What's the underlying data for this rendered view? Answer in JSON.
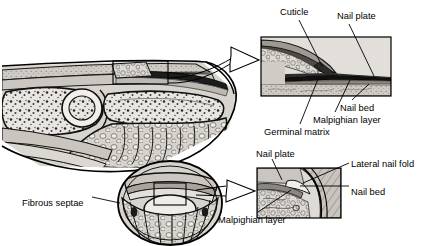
{
  "figure": {
    "type": "anatomical-illustration",
    "background_color": "#ffffff",
    "line_color": "#000000",
    "palette": {
      "tissue_light": "#d9d5d0",
      "tissue_mid": "#b8b3ad",
      "tissue_dark": "#8e8884",
      "bone_fill": "#e8e5e1",
      "nail_plate": "#1a1a1a",
      "outline": "#000000"
    }
  },
  "panels": {
    "sagittal": {
      "name": "Sagittal section of distal finger",
      "callout_box": {
        "x": 113,
        "y": 61,
        "w": 55,
        "h": 23
      }
    },
    "cross_section": {
      "name": "Transverse section of distal phalanx",
      "callout_box": {
        "x": 154,
        "y": 183,
        "w": 32,
        "h": 22
      }
    },
    "inset_top": {
      "name": "Magnified longitudinal view of proximal nail",
      "x": 261,
      "y": 37,
      "w": 130,
      "h": 59
    },
    "inset_bottom": {
      "name": "Magnified transverse view of lateral nail fold",
      "x": 257,
      "y": 168,
      "w": 84,
      "h": 50
    }
  },
  "labels": [
    {
      "id": "cuticle",
      "text": "Cuticle",
      "x": 280,
      "y": 8,
      "anchor": "start"
    },
    {
      "id": "nail-plate-top",
      "text": "Nail plate",
      "x": 337,
      "y": 12,
      "anchor": "start"
    },
    {
      "id": "nail-bed-top",
      "text": "Nail bed",
      "x": 340,
      "y": 104,
      "anchor": "start"
    },
    {
      "id": "malpighian-top",
      "text": "Malpighian layer",
      "x": 313,
      "y": 116,
      "anchor": "start"
    },
    {
      "id": "germinal-matrix",
      "text": "Germinal matrix",
      "x": 264,
      "y": 128,
      "anchor": "start"
    },
    {
      "id": "nail-plate-bottom",
      "text": "Nail plate",
      "x": 256,
      "y": 150,
      "anchor": "start"
    },
    {
      "id": "lateral-nail-fold",
      "text": "Lateral nail fold",
      "x": 351,
      "y": 160,
      "anchor": "start"
    },
    {
      "id": "nail-bed-bottom",
      "text": "Nail bed",
      "x": 351,
      "y": 188,
      "anchor": "start"
    },
    {
      "id": "malpighian-bottom",
      "text": "Malpighian layer",
      "x": 218,
      "y": 216,
      "anchor": "start"
    },
    {
      "id": "fibrous-septae",
      "text": "Fibrous septae",
      "x": 22,
      "y": 199,
      "anchor": "start"
    }
  ],
  "leader_lines": [
    {
      "id": "leader-cuticle",
      "from": [
        299,
        20
      ],
      "to": [
        322,
        66
      ]
    },
    {
      "id": "leader-nail-plate-top",
      "from": [
        349,
        24
      ],
      "to": [
        374,
        76
      ]
    },
    {
      "id": "leader-nail-bed-top",
      "from": [
        352,
        100
      ],
      "to": [
        369,
        84
      ]
    },
    {
      "id": "leader-malpighian-top",
      "from": [
        335,
        112
      ],
      "to": [
        350,
        80
      ]
    },
    {
      "id": "leader-germinal-matrix",
      "from": [
        300,
        124
      ],
      "to": [
        318,
        79
      ]
    },
    {
      "id": "leader-nail-plate-bottom",
      "from": [
        272,
        159
      ],
      "to": [
        282,
        180
      ]
    },
    {
      "id": "leader-lateral-nail-fold",
      "from": [
        349,
        163
      ],
      "to": [
        303,
        183
      ]
    },
    {
      "id": "leader-nail-bed-bottom",
      "from": [
        349,
        186
      ],
      "to": [
        300,
        186
      ]
    },
    {
      "id": "leader-malpighian-bottom",
      "from": [
        258,
        212
      ],
      "to": [
        291,
        190
      ]
    },
    {
      "id": "leader-fibrous-septae",
      "from": [
        92,
        197
      ],
      "to": [
        120,
        203
      ]
    }
  ],
  "arrows": [
    {
      "id": "arrow-to-inset-top",
      "tail": [
        168,
        78
      ],
      "head": [
        259,
        60
      ],
      "style": "hollow-outline"
    },
    {
      "id": "arrow-to-inset-bottom",
      "tail": [
        196,
        192
      ],
      "head": [
        255,
        191
      ],
      "style": "hollow-outline"
    }
  ]
}
